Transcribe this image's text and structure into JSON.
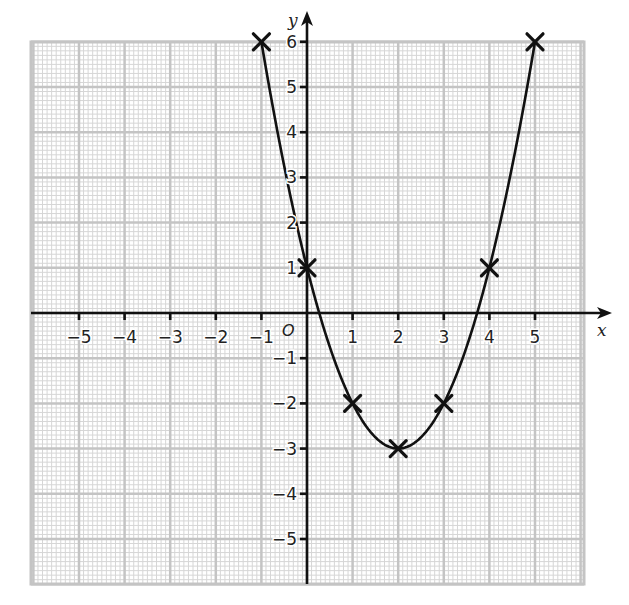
{
  "chart_data": {
    "type": "line",
    "title": "",
    "xlabel": "x",
    "ylabel": "y",
    "origin_label": "O",
    "xlim": [
      -6,
      6
    ],
    "ylim": [
      -6,
      6
    ],
    "grid": true,
    "grid_minor_per_unit": 10,
    "x_ticks": [
      -5,
      -4,
      -3,
      -2,
      -1,
      1,
      2,
      3,
      4,
      5
    ],
    "y_ticks": [
      6,
      5,
      4,
      3,
      2,
      1,
      -1,
      -2,
      -3,
      -4,
      -5
    ],
    "x_tick_labels": [
      "−5",
      "−4",
      "−3",
      "−2",
      "−1",
      "1",
      "2",
      "3",
      "4",
      "5"
    ],
    "y_tick_labels": [
      "6",
      "5",
      "4",
      "3",
      "2",
      "1",
      "−1",
      "−2",
      "−3",
      "−4",
      "−5"
    ],
    "series": [
      {
        "name": "y = x² − 4x + 1",
        "curve": "quadratic",
        "coefficients": {
          "a": 1,
          "b": -4,
          "c": 1
        },
        "x": [
          -1,
          0,
          1,
          2,
          3,
          4,
          5
        ],
        "y": [
          6,
          1,
          -2,
          -3,
          -2,
          1,
          6
        ],
        "marker": "x"
      }
    ],
    "legend": null
  },
  "colors": {
    "grid_minor": "#d6d6d6",
    "grid_major": "#c4c4c4",
    "axis": "#111111",
    "curve": "#111111"
  }
}
